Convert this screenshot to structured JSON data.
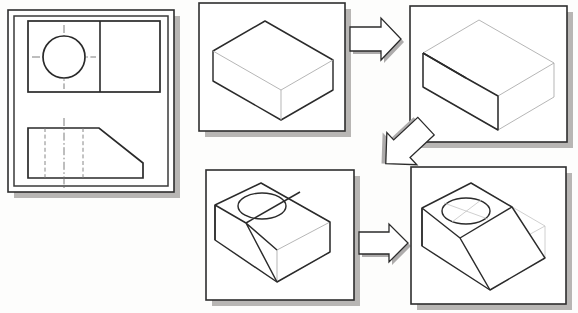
{
  "figure": {
    "title": "Isometric construction sequence of a chamfered block with a through hole",
    "background_color": "#fdfdfc",
    "width": 578,
    "height": 313,
    "line_color": "#2b2b2b",
    "shadow_color": "#b8b6b4",
    "construction_line_color": "#a9a9a9"
  },
  "panels": [
    {
      "id": "orthographic-views",
      "name": "orthographic-drawing-panel",
      "label": "Orthographic views",
      "x": 8,
      "y": 10,
      "w": 166,
      "h": 182,
      "contents": "Top view rectangle divided by a vertical line with a circle and centerlines; front view profile with chamfer, two hidden lines and a vertical centerline."
    },
    {
      "id": "step-1",
      "name": "step-1-panel",
      "label": "Step 1 - rectangular base block",
      "x": 199,
      "y": 3,
      "w": 146,
      "h": 128,
      "contents": "Plain isometric rectangular box."
    },
    {
      "id": "step-2",
      "name": "step-2-panel",
      "label": "Step 2 - chamfer layout lines",
      "x": 410,
      "y": 6,
      "w": 157,
      "h": 136,
      "contents": "Isometric box with layout lines marking the chamfer cut."
    },
    {
      "id": "step-3",
      "name": "step-3-panel",
      "label": "Step 3 - chamfer removed and hole added",
      "x": 206,
      "y": 170,
      "w": 148,
      "h": 130,
      "contents": "Chamfered block with circular hole drawn on top face."
    },
    {
      "id": "step-4",
      "name": "step-4-panel",
      "label": "Step 4 - completed solid model",
      "x": 411,
      "y": 167,
      "w": 155,
      "h": 137,
      "contents": "Finished chamfered block with hole and faint construction lines of removed material."
    }
  ],
  "arrows": [
    {
      "id": "arrow-1",
      "name": "arrow-step1-to-step2",
      "direction": "right",
      "from": "step-1",
      "to": "step-2"
    },
    {
      "id": "arrow-2",
      "name": "arrow-step2-to-step3",
      "direction": "down-left",
      "from": "step-2",
      "to": "step-3"
    },
    {
      "id": "arrow-3",
      "name": "arrow-step3-to-step4",
      "direction": "right",
      "from": "step-3",
      "to": "step-4"
    }
  ],
  "orthographic": {
    "top_view": {
      "name": "top-view",
      "feature": "circle-with-centerlines",
      "divider": "vertical-line"
    },
    "front_view": {
      "name": "front-view",
      "feature": "chamfered-profile",
      "hidden_lines": 2,
      "centerlines": 1
    }
  }
}
